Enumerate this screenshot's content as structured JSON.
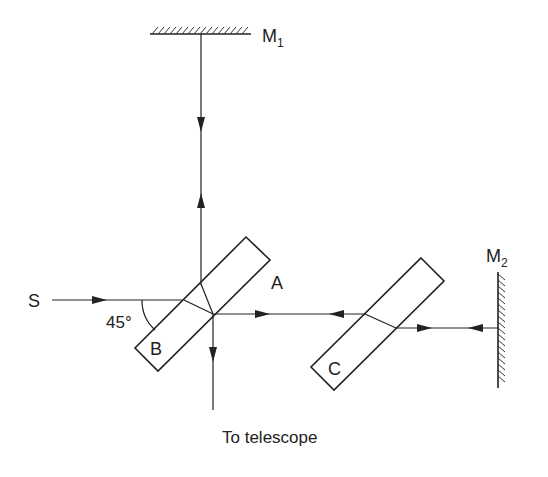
{
  "diagram": {
    "labels": {
      "mirror1": "M",
      "mirror1_sub": "1",
      "mirror2": "M",
      "mirror2_sub": "2",
      "source": "S",
      "angle": "45°",
      "beamsplitter_face_a": "A",
      "beamsplitter_face_b": "B",
      "compensator": "C",
      "output": "To telescope"
    },
    "components": [
      {
        "id": "M1",
        "type": "mirror",
        "orientation": "horizontal"
      },
      {
        "id": "M2",
        "type": "mirror",
        "orientation": "vertical"
      },
      {
        "id": "beamsplitter",
        "type": "glass-plate",
        "faces": [
          "A",
          "B"
        ],
        "angle_deg": 45
      },
      {
        "id": "C",
        "type": "compensating-plate",
        "angle_deg": 45
      }
    ],
    "beams": [
      {
        "from": "S",
        "to": "beamsplitter",
        "direction": "right"
      },
      {
        "from": "beamsplitter",
        "to": "M1",
        "direction": "up"
      },
      {
        "from": "M1",
        "to": "beamsplitter",
        "direction": "down"
      },
      {
        "from": "beamsplitter",
        "to": "M2",
        "via": "C",
        "direction": "right"
      },
      {
        "from": "M2",
        "to": "beamsplitter",
        "via": "C",
        "direction": "left"
      },
      {
        "from": "beamsplitter",
        "to": "telescope",
        "direction": "down"
      }
    ],
    "colors": {
      "ink": "#222222",
      "background": "#ffffff"
    }
  }
}
